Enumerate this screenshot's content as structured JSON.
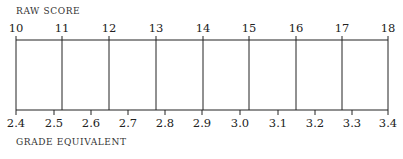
{
  "top_label": "RAW SCORE",
  "bottom_label": "GRADE EQUIVALENT",
  "raw_scores": [
    {
      "label": "10",
      "x": 16
    },
    {
      "label": "11",
      "x": 62
    },
    {
      "label": "12",
      "x": 109
    },
    {
      "label": "13",
      "x": 156
    },
    {
      "label": "14",
      "x": 203
    },
    {
      "label": "15",
      "x": 249
    },
    {
      "label": "16",
      "x": 296
    },
    {
      "label": "17",
      "x": 342
    },
    {
      "label": "18",
      "x": 388
    }
  ],
  "grade_equivalents": [
    {
      "label": "2.4",
      "x": 16
    },
    {
      "label": "2.5",
      "x": 54
    },
    {
      "label": "2.6",
      "x": 91
    },
    {
      "label": "2.7",
      "x": 128
    },
    {
      "label": "2.8",
      "x": 165
    },
    {
      "label": "2.9",
      "x": 202
    },
    {
      "label": "3.0",
      "x": 240
    },
    {
      "label": "3.1",
      "x": 278
    },
    {
      "label": "3.2",
      "x": 315
    },
    {
      "label": "3.3",
      "x": 352
    },
    {
      "label": "3.4",
      "x": 388
    }
  ],
  "colors": {
    "line": "#222222",
    "text": "#222222",
    "background": "#ffffff"
  }
}
